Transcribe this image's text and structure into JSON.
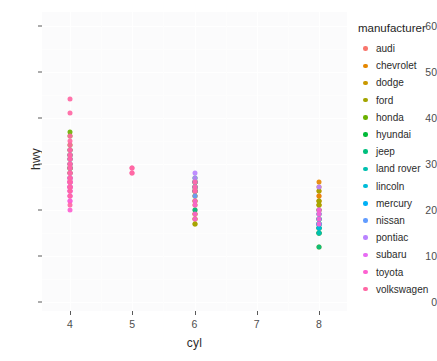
{
  "chart_data": {
    "type": "scatter",
    "title": "",
    "xlabel": "cyl",
    "ylabel": "hwy",
    "xlim": [
      3.55,
      8.45
    ],
    "ylim": [
      -2,
      63
    ],
    "x_ticks": [
      4,
      5,
      6,
      7,
      8
    ],
    "y_ticks": [
      0,
      10,
      20,
      30,
      40,
      50,
      60
    ],
    "grid": true,
    "legend_position": "right",
    "legend_title": "manufacturer",
    "color_key": "manufacturer",
    "series": [
      {
        "name": "audi",
        "color": "#F8766D",
        "points": [
          {
            "x": 4,
            "y": 26
          },
          {
            "x": 4,
            "y": 25
          },
          {
            "x": 4,
            "y": 28
          },
          {
            "x": 4,
            "y": 27
          },
          {
            "x": 4,
            "y": 25
          },
          {
            "x": 4,
            "y": 26
          },
          {
            "x": 4,
            "y": 28
          },
          {
            "x": 4,
            "y": 29
          },
          {
            "x": 4,
            "y": 29
          },
          {
            "x": 6,
            "y": 24
          },
          {
            "x": 6,
            "y": 25
          },
          {
            "x": 6,
            "y": 23
          },
          {
            "x": 6,
            "y": 20
          },
          {
            "x": 6,
            "y": 26
          },
          {
            "x": 6,
            "y": 26
          },
          {
            "x": 6,
            "y": 25
          },
          {
            "x": 6,
            "y": 24
          },
          {
            "x": 8,
            "y": 23
          }
        ]
      },
      {
        "name": "chevrolet",
        "color": "#E58700",
        "points": [
          {
            "x": 8,
            "y": 26
          },
          {
            "x": 8,
            "y": 25
          },
          {
            "x": 8,
            "y": 24
          },
          {
            "x": 8,
            "y": 21
          },
          {
            "x": 8,
            "y": 22
          },
          {
            "x": 8,
            "y": 23
          },
          {
            "x": 8,
            "y": 20
          },
          {
            "x": 8,
            "y": 17
          },
          {
            "x": 8,
            "y": 16
          },
          {
            "x": 8,
            "y": 15
          },
          {
            "x": 6,
            "y": 26
          },
          {
            "x": 6,
            "y": 25
          },
          {
            "x": 6,
            "y": 24
          },
          {
            "x": 6,
            "y": 19
          },
          {
            "x": 4,
            "y": 30
          },
          {
            "x": 4,
            "y": 29
          },
          {
            "x": 4,
            "y": 26
          }
        ]
      },
      {
        "name": "dodge",
        "color": "#C99800",
        "points": [
          {
            "x": 8,
            "y": 22
          },
          {
            "x": 8,
            "y": 21
          },
          {
            "x": 8,
            "y": 20
          },
          {
            "x": 8,
            "y": 18
          },
          {
            "x": 8,
            "y": 17
          },
          {
            "x": 8,
            "y": 16
          },
          {
            "x": 8,
            "y": 15
          },
          {
            "x": 8,
            "y": 12
          },
          {
            "x": 6,
            "y": 24
          },
          {
            "x": 6,
            "y": 23
          },
          {
            "x": 6,
            "y": 22
          },
          {
            "x": 6,
            "y": 21
          },
          {
            "x": 6,
            "y": 18
          },
          {
            "x": 6,
            "y": 17
          },
          {
            "x": 4,
            "y": 26
          },
          {
            "x": 4,
            "y": 25
          }
        ]
      },
      {
        "name": "ford",
        "color": "#A3A500",
        "points": [
          {
            "x": 8,
            "y": 24
          },
          {
            "x": 8,
            "y": 22
          },
          {
            "x": 8,
            "y": 21
          },
          {
            "x": 8,
            "y": 20
          },
          {
            "x": 8,
            "y": 19
          },
          {
            "x": 8,
            "y": 18
          },
          {
            "x": 8,
            "y": 17
          },
          {
            "x": 8,
            "y": 15
          },
          {
            "x": 6,
            "y": 26
          },
          {
            "x": 6,
            "y": 25
          },
          {
            "x": 6,
            "y": 24
          },
          {
            "x": 6,
            "y": 22
          },
          {
            "x": 6,
            "y": 19
          },
          {
            "x": 6,
            "y": 18
          },
          {
            "x": 6,
            "y": 17
          }
        ]
      },
      {
        "name": "honda",
        "color": "#6BB100",
        "points": [
          {
            "x": 4,
            "y": 36
          },
          {
            "x": 4,
            "y": 37
          },
          {
            "x": 4,
            "y": 34
          },
          {
            "x": 4,
            "y": 33
          },
          {
            "x": 4,
            "y": 32
          },
          {
            "x": 4,
            "y": 32
          },
          {
            "x": 4,
            "y": 29
          },
          {
            "x": 4,
            "y": 29
          },
          {
            "x": 4,
            "y": 31
          }
        ]
      },
      {
        "name": "hyundai",
        "color": "#00BA38",
        "points": [
          {
            "x": 4,
            "y": 30
          },
          {
            "x": 4,
            "y": 31
          },
          {
            "x": 4,
            "y": 33
          },
          {
            "x": 4,
            "y": 32
          },
          {
            "x": 4,
            "y": 29
          },
          {
            "x": 4,
            "y": 28
          },
          {
            "x": 4,
            "y": 27
          },
          {
            "x": 6,
            "y": 26
          },
          {
            "x": 6,
            "y": 25
          },
          {
            "x": 6,
            "y": 24
          },
          {
            "x": 6,
            "y": 27
          },
          {
            "x": 6,
            "y": 26
          },
          {
            "x": 6,
            "y": 25
          },
          {
            "x": 6,
            "y": 24
          }
        ]
      },
      {
        "name": "jeep",
        "color": "#00BF7D",
        "points": [
          {
            "x": 8,
            "y": 17
          },
          {
            "x": 8,
            "y": 15
          },
          {
            "x": 8,
            "y": 18
          },
          {
            "x": 8,
            "y": 17
          },
          {
            "x": 8,
            "y": 16
          },
          {
            "x": 8,
            "y": 18
          },
          {
            "x": 8,
            "y": 12
          },
          {
            "x": 6,
            "y": 20
          }
        ]
      },
      {
        "name": "land rover",
        "color": "#00C0AF",
        "points": [
          {
            "x": 8,
            "y": 15
          },
          {
            "x": 8,
            "y": 16
          },
          {
            "x": 8,
            "y": 15
          },
          {
            "x": 8,
            "y": 16
          }
        ]
      },
      {
        "name": "lincoln",
        "color": "#00BCD8",
        "points": [
          {
            "x": 8,
            "y": 17
          },
          {
            "x": 8,
            "y": 16
          },
          {
            "x": 8,
            "y": 17
          }
        ]
      },
      {
        "name": "mercury",
        "color": "#00B0F6",
        "points": [
          {
            "x": 8,
            "y": 17
          },
          {
            "x": 8,
            "y": 18
          },
          {
            "x": 8,
            "y": 17
          },
          {
            "x": 8,
            "y": 19
          }
        ]
      },
      {
        "name": "nissan",
        "color": "#619CFF",
        "points": [
          {
            "x": 4,
            "y": 32
          },
          {
            "x": 4,
            "y": 31
          },
          {
            "x": 4,
            "y": 30
          },
          {
            "x": 4,
            "y": 29
          },
          {
            "x": 4,
            "y": 27
          },
          {
            "x": 6,
            "y": 26
          },
          {
            "x": 6,
            "y": 25
          },
          {
            "x": 6,
            "y": 24
          },
          {
            "x": 6,
            "y": 23
          },
          {
            "x": 8,
            "y": 19
          },
          {
            "x": 8,
            "y": 18
          },
          {
            "x": 8,
            "y": 17
          },
          {
            "x": 8,
            "y": 20
          }
        ]
      },
      {
        "name": "pontiac",
        "color": "#B983FF",
        "points": [
          {
            "x": 6,
            "y": 26
          },
          {
            "x": 6,
            "y": 25
          },
          {
            "x": 6,
            "y": 28
          },
          {
            "x": 6,
            "y": 27
          },
          {
            "x": 8,
            "y": 25
          }
        ]
      },
      {
        "name": "subaru",
        "color": "#E76BF3",
        "points": [
          {
            "x": 4,
            "y": 25
          },
          {
            "x": 4,
            "y": 26
          },
          {
            "x": 4,
            "y": 27
          },
          {
            "x": 4,
            "y": 25
          },
          {
            "x": 4,
            "y": 24
          },
          {
            "x": 4,
            "y": 26
          },
          {
            "x": 4,
            "y": 25
          },
          {
            "x": 4,
            "y": 26
          },
          {
            "x": 4,
            "y": 27
          },
          {
            "x": 4,
            "y": 24
          },
          {
            "x": 4,
            "y": 23
          },
          {
            "x": 4,
            "y": 22
          },
          {
            "x": 4,
            "y": 26
          },
          {
            "x": 4,
            "y": 25
          }
        ]
      },
      {
        "name": "toyota",
        "color": "#FD61D1",
        "points": [
          {
            "x": 4,
            "y": 33
          },
          {
            "x": 4,
            "y": 32
          },
          {
            "x": 4,
            "y": 31
          },
          {
            "x": 4,
            "y": 30
          },
          {
            "x": 4,
            "y": 29
          },
          {
            "x": 4,
            "y": 28
          },
          {
            "x": 4,
            "y": 27
          },
          {
            "x": 4,
            "y": 26
          },
          {
            "x": 4,
            "y": 25
          },
          {
            "x": 4,
            "y": 24
          },
          {
            "x": 4,
            "y": 23
          },
          {
            "x": 4,
            "y": 22
          },
          {
            "x": 4,
            "y": 20
          },
          {
            "x": 6,
            "y": 24
          },
          {
            "x": 6,
            "y": 22
          },
          {
            "x": 6,
            "y": 21
          },
          {
            "x": 6,
            "y": 19
          },
          {
            "x": 6,
            "y": 18
          },
          {
            "x": 8,
            "y": 20
          },
          {
            "x": 8,
            "y": 19
          },
          {
            "x": 8,
            "y": 18
          },
          {
            "x": 8,
            "y": 17
          }
        ]
      },
      {
        "name": "volkswagen",
        "color": "#FF67A4",
        "points": [
          {
            "x": 4,
            "y": 44
          },
          {
            "x": 4,
            "y": 41
          },
          {
            "x": 4,
            "y": 36
          },
          {
            "x": 4,
            "y": 35
          },
          {
            "x": 4,
            "y": 34
          },
          {
            "x": 4,
            "y": 33
          },
          {
            "x": 4,
            "y": 32
          },
          {
            "x": 4,
            "y": 31
          },
          {
            "x": 4,
            "y": 30
          },
          {
            "x": 4,
            "y": 29
          },
          {
            "x": 4,
            "y": 28
          },
          {
            "x": 4,
            "y": 27
          },
          {
            "x": 4,
            "y": 26
          },
          {
            "x": 4,
            "y": 25
          },
          {
            "x": 4,
            "y": 24
          },
          {
            "x": 4,
            "y": 23
          },
          {
            "x": 4,
            "y": 21
          },
          {
            "x": 5,
            "y": 29
          },
          {
            "x": 5,
            "y": 28
          },
          {
            "x": 5,
            "y": 29
          },
          {
            "x": 5,
            "y": 28
          },
          {
            "x": 6,
            "y": 26
          },
          {
            "x": 6,
            "y": 25
          },
          {
            "x": 6,
            "y": 24
          }
        ]
      }
    ]
  },
  "axes": {
    "y_title": "hwy",
    "x_title": "cyl",
    "y_tick_labels": [
      "0",
      "10",
      "20",
      "30",
      "40",
      "50",
      "60"
    ],
    "x_tick_labels": [
      "4",
      "5",
      "6",
      "7",
      "8"
    ]
  },
  "legend": {
    "title": "manufacturer",
    "items": [
      {
        "label": "audi",
        "color": "#F8766D"
      },
      {
        "label": "chevrolet",
        "color": "#E58700"
      },
      {
        "label": "dodge",
        "color": "#C99800"
      },
      {
        "label": "ford",
        "color": "#A3A500"
      },
      {
        "label": "honda",
        "color": "#6BB100"
      },
      {
        "label": "hyundai",
        "color": "#00BA38"
      },
      {
        "label": "jeep",
        "color": "#00BF7D"
      },
      {
        "label": "land rover",
        "color": "#00C0AF"
      },
      {
        "label": "lincoln",
        "color": "#00BCD8"
      },
      {
        "label": "mercury",
        "color": "#00B0F6"
      },
      {
        "label": "nissan",
        "color": "#619CFF"
      },
      {
        "label": "pontiac",
        "color": "#B983FF"
      },
      {
        "label": "subaru",
        "color": "#E76BF3"
      },
      {
        "label": "toyota",
        "color": "#FD61D1"
      },
      {
        "label": "volkswagen",
        "color": "#FF67A4"
      }
    ]
  },
  "theme": {
    "panel_background": "#fbfbfc",
    "grid_color": "#ffffff",
    "plot_background": "#ffffff",
    "text_color": "#2b2b2b"
  }
}
